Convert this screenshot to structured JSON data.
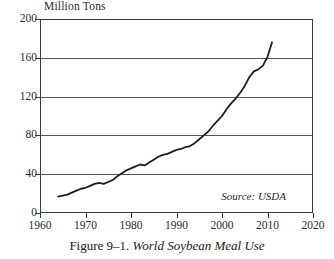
{
  "caption": {
    "number": "Figure 9–1.",
    "title": "World Soybean Meal Use"
  },
  "source_note": "Source: USDA",
  "chart_data": {
    "type": "line",
    "title": "World Soybean Meal Use",
    "xlabel": "",
    "ylabel": "Million Tons",
    "unit_label": "Million Tons",
    "xlim": [
      1960,
      2020
    ],
    "ylim": [
      0,
      200
    ],
    "xticks": [
      1960,
      1970,
      1980,
      1990,
      2000,
      2010,
      2020
    ],
    "yticks": [
      0,
      40,
      80,
      120,
      160,
      200
    ],
    "grid": "horizontal",
    "legend": "none",
    "annotations": [
      "Source: USDA"
    ],
    "series": [
      {
        "name": "World Soybean Meal Use",
        "color": "#1e1e1e",
        "x": [
          1964,
          1965,
          1966,
          1967,
          1968,
          1969,
          1970,
          1971,
          1972,
          1973,
          1974,
          1975,
          1976,
          1977,
          1978,
          1979,
          1980,
          1981,
          1982,
          1983,
          1984,
          1985,
          1986,
          1987,
          1988,
          1989,
          1990,
          1991,
          1992,
          1993,
          1994,
          1995,
          1996,
          1997,
          1998,
          1999,
          2000,
          2001,
          2002,
          2003,
          2004,
          2005,
          2006,
          2007,
          2008,
          2009,
          2010,
          2011
        ],
        "values": [
          17,
          18,
          19,
          21,
          23,
          25,
          26,
          28,
          30,
          31,
          30,
          32,
          34,
          38,
          41,
          44,
          46,
          48,
          50,
          49,
          52,
          55,
          58,
          60,
          61,
          63,
          65,
          66,
          68,
          69,
          72,
          76,
          80,
          84,
          90,
          95,
          100,
          107,
          113,
          118,
          124,
          131,
          140,
          146,
          148,
          152,
          161,
          176
        ]
      }
    ]
  }
}
